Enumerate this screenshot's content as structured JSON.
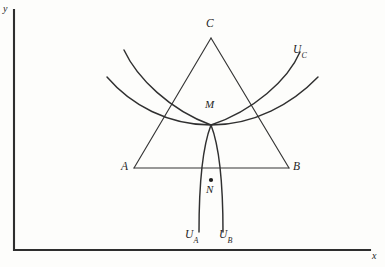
{
  "figure": {
    "kind": "geometric-diagram",
    "background_color": "#fdfdfb",
    "ink_color": "#2e2e2e",
    "width": 385,
    "height": 267
  },
  "axes": {
    "x_label": "x",
    "y_label": "y",
    "origin": {
      "x": 14,
      "y": 250
    },
    "x_axis_end": {
      "x": 370,
      "y": 250
    },
    "y_axis_end": {
      "x": 14,
      "y": 10
    }
  },
  "triangle": {
    "name": "ABC",
    "vertices": [
      {
        "label": "A",
        "x": 134,
        "y": 168
      },
      {
        "label": "B",
        "x": 289,
        "y": 168
      },
      {
        "label": "C",
        "x": 211,
        "y": 38
      }
    ]
  },
  "points": [
    {
      "label": "M",
      "x": 211,
      "y": 125,
      "has_dot": false,
      "description": "common intersection of the three curves"
    },
    {
      "label": "N",
      "x": 211,
      "y": 180,
      "has_dot": true,
      "description": "point inside the lens below the base AB"
    }
  ],
  "curves": [
    {
      "label": "U_A",
      "label_text": "U",
      "label_subscript": "A",
      "description": "arc from upper-left, descending through M and continuing down-right to the lower endpoint"
    },
    {
      "label": "U_B",
      "label_text": "U",
      "label_subscript": "B",
      "description": "arc from upper-right, descending through M and continuing down-left to the lower endpoint"
    },
    {
      "label": "U_C",
      "label_text": "U",
      "label_subscript": "C",
      "description": "wide upward-opening arc passing through M spanning left to right"
    }
  ]
}
